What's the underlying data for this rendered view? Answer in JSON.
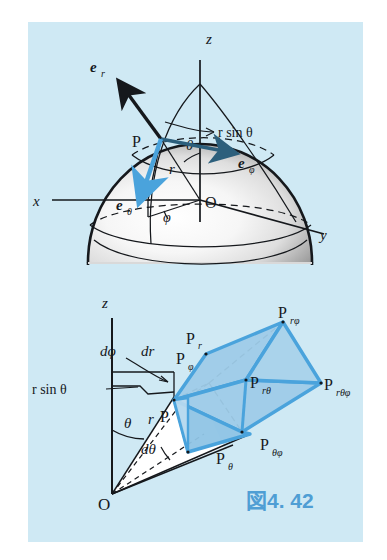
{
  "figure": {
    "caption": "図4. 42",
    "caption_color": "#4f9ed4",
    "panel_bg": "#cfe9f4",
    "accent_blue": "#4aa3dc",
    "fill_blue": "#9ecbe8",
    "ink": "#15181c"
  },
  "top_diagram": {
    "name": "sphere-spherical-coordinates",
    "axes": [
      {
        "id": "z",
        "label": "z"
      },
      {
        "id": "x",
        "label": "x"
      },
      {
        "id": "y",
        "label": "y"
      }
    ],
    "points": [
      {
        "id": "P",
        "label": "P"
      },
      {
        "id": "O",
        "label": "O"
      }
    ],
    "unit_vectors": [
      {
        "id": "e_r",
        "base": "e",
        "sub": "r",
        "color": "#15181c"
      },
      {
        "id": "e_phi",
        "base": "e",
        "sub": "φ",
        "color": "#2c5f7c"
      },
      {
        "id": "e_theta",
        "base": "e",
        "sub": "θ",
        "color": "#4aa3dc"
      }
    ],
    "annotations": [
      {
        "id": "r-sin-theta",
        "label": "r sin θ"
      },
      {
        "id": "theta",
        "label": "θ"
      },
      {
        "id": "phi",
        "label": "φ"
      },
      {
        "id": "r",
        "label": "r"
      }
    ]
  },
  "bottom_diagram": {
    "name": "volume-element-spherical",
    "axes": [
      {
        "id": "z",
        "label": "z"
      }
    ],
    "origin": {
      "id": "O",
      "label": "O"
    },
    "annotations": [
      {
        "id": "r-sin-theta",
        "label": "r sin θ"
      },
      {
        "id": "d-phi",
        "base": "d",
        "sub": "φ",
        "label": "dφ"
      },
      {
        "id": "d-r",
        "label": "dr"
      },
      {
        "id": "d-theta",
        "label": "dθ"
      },
      {
        "id": "theta",
        "label": "θ"
      },
      {
        "id": "r",
        "label": "r"
      }
    ],
    "vertices": [
      {
        "id": "P",
        "base": "P",
        "sub": ""
      },
      {
        "id": "P_r",
        "base": "P",
        "sub": "r"
      },
      {
        "id": "P_phi",
        "base": "P",
        "sub": "φ"
      },
      {
        "id": "P_theta",
        "base": "P",
        "sub": "θ"
      },
      {
        "id": "P_rphi",
        "base": "P",
        "sub": "rφ"
      },
      {
        "id": "P_rtheta",
        "base": "P",
        "sub": "rθ"
      },
      {
        "id": "P_thetaphi",
        "base": "P",
        "sub": "θφ"
      },
      {
        "id": "P_rthetaphi",
        "base": "P",
        "sub": "rθφ"
      }
    ]
  }
}
